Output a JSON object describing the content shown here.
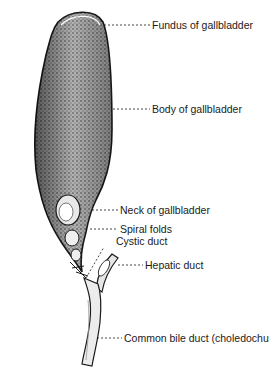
{
  "figure": {
    "colors": {
      "ink": "#1a1a1a",
      "paper": "#ffffff",
      "shade": "#6b6b6b"
    },
    "labels": [
      {
        "id": "fundus",
        "text": "Fundus of gallbladder",
        "x": 152,
        "y": 20,
        "anchor_x": 103,
        "anchor_y": 25
      },
      {
        "id": "body",
        "text": "Body of gallbladder",
        "x": 152,
        "y": 104,
        "anchor_x": 113,
        "anchor_y": 109
      },
      {
        "id": "neck",
        "text": "Neck of gallbladder",
        "x": 120,
        "y": 205,
        "anchor_x": 90,
        "anchor_y": 210
      },
      {
        "id": "spiral-folds",
        "text": "Spiral folds",
        "x": 120,
        "y": 224,
        "anchor_x": 90,
        "anchor_y": 229
      },
      {
        "id": "cystic-duct",
        "text": "Cystic duct",
        "x": 116,
        "y": 236,
        "anchor_x": 88,
        "anchor_y": 278
      },
      {
        "id": "hepatic-duct",
        "text": "Hepatic duct",
        "x": 145,
        "y": 260,
        "anchor_x": 112,
        "anchor_y": 265
      },
      {
        "id": "common-bile-duct",
        "text": "Common bile duct (choledochus)",
        "x": 124,
        "y": 333,
        "anchor_x": 95,
        "anchor_y": 338
      }
    ]
  }
}
